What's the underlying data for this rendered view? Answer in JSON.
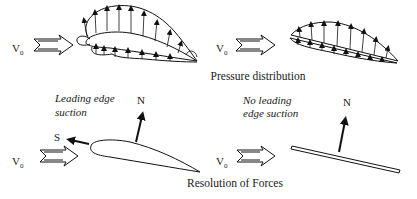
{
  "figure": {
    "colors": {
      "ink": "#111111",
      "background": "#ffffff"
    },
    "panels": {
      "pressure_airfoil": {
        "freestream_label": "V",
        "freestream_sub": "0",
        "icon": "double-outline-arrow"
      },
      "pressure_plate": {
        "freestream_label": "V",
        "freestream_sub": "0",
        "icon": "double-outline-arrow"
      },
      "forces_airfoil": {
        "note_line1": "Leading edge",
        "note_line2": "suction",
        "normal_label": "N",
        "suction_label": "S",
        "freestream_label": "V",
        "freestream_sub": "0"
      },
      "forces_plate": {
        "note_line1": "No leading",
        "note_line2": "edge suction",
        "normal_label": "N",
        "freestream_label": "V",
        "freestream_sub": "0"
      }
    },
    "captions": {
      "top": "Pressure distribution",
      "bottom": "Resolution of Forces"
    }
  }
}
